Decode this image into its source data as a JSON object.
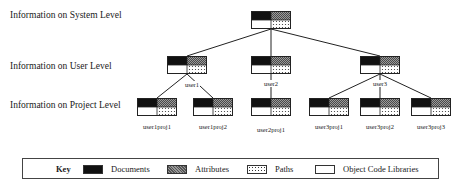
{
  "levels": [
    {
      "label": "Information on System Level"
    },
    {
      "label": "Information on User Level"
    },
    {
      "label": "Information on Project Level"
    }
  ],
  "nodes": {
    "system": {
      "label": ""
    },
    "users": [
      {
        "label": "user1"
      },
      {
        "label": "user2"
      },
      {
        "label": "user3"
      }
    ],
    "projects": [
      {
        "label": "user1proj1"
      },
      {
        "label": "user1proj2"
      },
      {
        "label": "user2proj1"
      },
      {
        "label": "user3proj1"
      },
      {
        "label": "user3proj2"
      },
      {
        "label": "user3proj3"
      }
    ]
  },
  "legend": {
    "title": "Key",
    "items": [
      {
        "label": "Documents",
        "pattern": "solid-black"
      },
      {
        "label": "Attributes",
        "pattern": "crosshatch-gray"
      },
      {
        "label": "Paths",
        "pattern": "dotted"
      },
      {
        "label": "Object Code Libraries",
        "pattern": "blank-white"
      }
    ]
  }
}
